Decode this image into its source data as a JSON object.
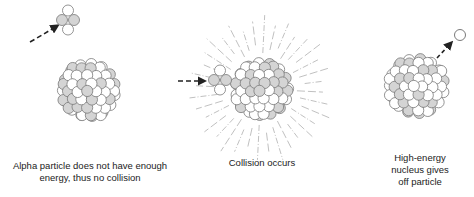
{
  "colors": {
    "proton": "#d4d4d4",
    "neutron": "#ffffff",
    "outline": "#7a7a7a",
    "arrow": "#222222",
    "burst": "#b0b0b0",
    "text": "#222222"
  },
  "panels": [
    {
      "id": "no-collision",
      "caption": [
        "Alpha particle does not have enough",
        "energy, thus no collision"
      ],
      "alpha_particle": "approaching, deflected",
      "outcome": "no collision"
    },
    {
      "id": "collision",
      "caption": [
        "Collision occurs"
      ],
      "alpha_particle": "striking nucleus",
      "outcome": "collision with energy burst"
    },
    {
      "id": "emission",
      "caption": [
        "High-energy",
        "nucleus gives",
        "off particle"
      ],
      "alpha_particle": "absent",
      "outcome": "particle emitted"
    }
  ],
  "legend_semantics": {
    "shaded_sphere": "proton",
    "white_sphere": "neutron"
  }
}
